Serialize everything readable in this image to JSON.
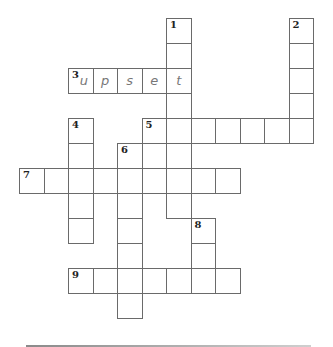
{
  "puzzle": {
    "grid": {
      "origin_x": 19,
      "origin_y": 18,
      "cell_w": 24.5,
      "cell_h": 25
    },
    "words": [
      {
        "number": "1",
        "direction": "down",
        "row": 0,
        "col": 6,
        "length": 8,
        "answer": ""
      },
      {
        "number": "2",
        "direction": "down",
        "row": 0,
        "col": 11,
        "length": 5,
        "answer": ""
      },
      {
        "number": "3",
        "direction": "across",
        "row": 2,
        "col": 2,
        "length": 5,
        "answer": "upset"
      },
      {
        "number": "4",
        "direction": "down",
        "row": 4,
        "col": 2,
        "length": 5,
        "answer": ""
      },
      {
        "number": "5",
        "direction": "across",
        "row": 4,
        "col": 5,
        "length": 7,
        "answer": ""
      },
      {
        "number": "6",
        "direction": "down",
        "row": 5,
        "col": 4,
        "length": 7,
        "answer": ""
      },
      {
        "number": "7",
        "direction": "across",
        "row": 6,
        "col": 0,
        "length": 9,
        "answer": ""
      },
      {
        "number": "8",
        "direction": "down",
        "row": 8,
        "col": 7,
        "length": 3,
        "answer": ""
      },
      {
        "number": "9",
        "direction": "across",
        "row": 10,
        "col": 2,
        "length": 7,
        "answer": ""
      }
    ]
  },
  "colors": {
    "grid_line": "#6a6a6a",
    "number": "#222222",
    "entry_letter": "#777777"
  }
}
